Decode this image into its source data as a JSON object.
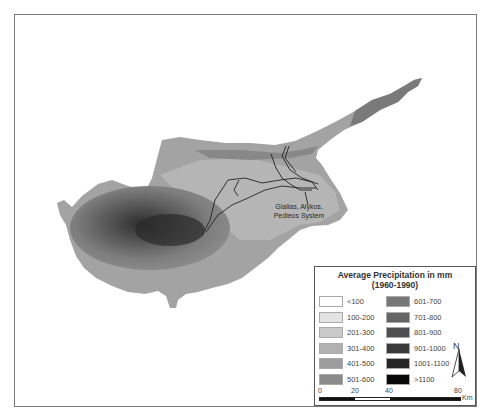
{
  "map": {
    "region_label": "Cyprus",
    "annotation": {
      "line1": "Gialias, Alykos,",
      "line2": "Pedieos System"
    },
    "river_color": "#222222"
  },
  "legend": {
    "title_line1": "Average Precipitation in mm",
    "title_line2": "(1960-1990)",
    "classes": [
      {
        "label": "<100",
        "color": "#ffffff"
      },
      {
        "label": "100-200",
        "color": "#e3e3e3"
      },
      {
        "label": "201-300",
        "color": "#c9c9c9"
      },
      {
        "label": "301-400",
        "color": "#b1b1b1"
      },
      {
        "label": "401-500",
        "color": "#9c9c9c"
      },
      {
        "label": "501-600",
        "color": "#8a8a8a"
      },
      {
        "label": "601-700",
        "color": "#777777"
      },
      {
        "label": "701-800",
        "color": "#656565"
      },
      {
        "label": "801-900",
        "color": "#4f4f4f"
      },
      {
        "label": "901-1000",
        "color": "#3a3a3a"
      },
      {
        "label": "1001-1100",
        "color": "#252525"
      },
      {
        "label": ">1100",
        "color": "#080808"
      }
    ]
  },
  "north_arrow": {
    "label": "N",
    "icon": "north-arrow-icon"
  },
  "scale_bar": {
    "ticks": [
      "0",
      "20",
      "40",
      "80"
    ],
    "unit": "Km"
  }
}
